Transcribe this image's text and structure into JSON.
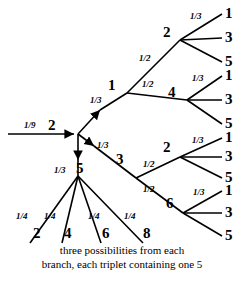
{
  "diagram": {
    "stroke_color": "#000000",
    "background_color": "#ffffff",
    "root": {
      "entry_probability": "1/9",
      "entry_label": "2"
    },
    "level1": [
      {
        "label": "1",
        "probability": "1/3"
      },
      {
        "label": "3",
        "probability": "1/3"
      },
      {
        "label": "5",
        "probability": "1/3"
      }
    ],
    "level2": [
      {
        "parent": "1",
        "label": "2",
        "probability": "1/2"
      },
      {
        "parent": "1",
        "label": "4",
        "probability": "1/2"
      },
      {
        "parent": "3",
        "label": "2",
        "probability": "1/2"
      },
      {
        "parent": "3",
        "label": "6",
        "probability": "1/2"
      }
    ],
    "leaf_groups": [
      {
        "parent": "2",
        "probability": "1/3",
        "leaves": [
          "1",
          "3",
          "5"
        ]
      },
      {
        "parent": "4",
        "probability": "1/3",
        "leaves": [
          "1",
          "3",
          "5"
        ]
      },
      {
        "parent": "2",
        "probability": "1/3",
        "leaves": [
          "1",
          "3",
          "5"
        ]
      },
      {
        "parent": "6",
        "probability": "1/3",
        "leaves": [
          "1",
          "3",
          "5"
        ]
      }
    ],
    "five_branch": {
      "probability_each": "1/4",
      "leaves": [
        "2",
        "4",
        "6",
        "8"
      ]
    },
    "caption_line1": "three possibilities from each",
    "caption_line2": "branch, each triplet containing one 5",
    "labels": {
      "p_1_9": "1/9",
      "root_2": "2",
      "p13_a": "1/3",
      "node_1": "1",
      "p13_b": "1/3",
      "node_3": "3",
      "p13_c": "1/3",
      "node_5": "5",
      "p12_a": "1/2",
      "node_2_top": "2",
      "p12_b": "1/2",
      "node_4": "4",
      "p12_c": "1/2",
      "node_2_bot": "2",
      "p12_d": "1/2",
      "node_6": "6",
      "g1_p": "1/3",
      "g1_l1": "1",
      "g1_l2": "3",
      "g1_l3": "5",
      "g2_p": "1/3",
      "g2_l1": "1",
      "g2_l2": "3",
      "g2_l3": "5",
      "g3_p": "1/3",
      "g3_l1": "1",
      "g3_l2": "3",
      "g3_l3": "5",
      "g4_p": "1/3",
      "g4_l1": "1",
      "g4_l2": "3",
      "g4_l3": "5",
      "q1": "1/4",
      "q2": "1/4",
      "q3": "1/4",
      "q4": "1/4",
      "leaf_2": "2",
      "leaf_4": "4",
      "leaf_6": "6",
      "leaf_8": "8"
    }
  }
}
